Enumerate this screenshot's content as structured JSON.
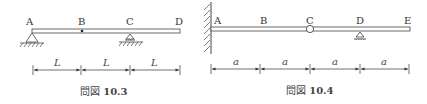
{
  "figures": [
    {
      "caption_prefix": "問図",
      "caption_number": "10.3",
      "points": [
        "A",
        "B",
        "C",
        "D"
      ],
      "supports": {
        "A": "pin",
        "B": "hinge-dot",
        "C": "roller"
      },
      "dimension_label": "L",
      "dimensions": [
        "L",
        "L",
        "L"
      ]
    },
    {
      "caption_prefix": "問図",
      "caption_number": "10.4",
      "points": [
        "A",
        "B",
        "C",
        "D",
        "E"
      ],
      "supports": {
        "A": "fixed-wall",
        "C": "hinge",
        "D": "roller"
      },
      "dimension_label": "a",
      "dimensions": [
        "a",
        "a",
        "a",
        "a"
      ]
    }
  ]
}
